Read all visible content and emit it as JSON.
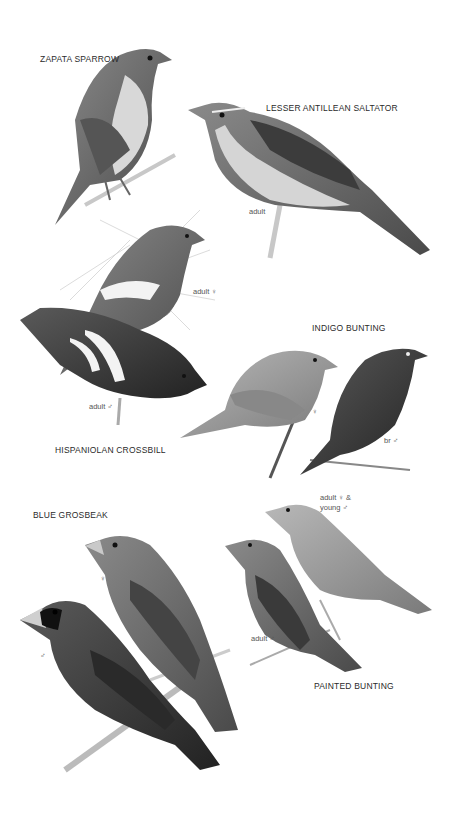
{
  "plate": {
    "species": [
      {
        "name": "ZAPATA SPARROW",
        "labels": []
      },
      {
        "name": "LESSER ANTILLEAN SALTATOR",
        "labels": [
          "adult"
        ]
      },
      {
        "name": "HISPANIOLAN CROSSBILL",
        "labels": [
          "adult ♀",
          "adult ♂"
        ]
      },
      {
        "name": "INDIGO BUNTING",
        "labels": [
          "♀",
          "br ♂"
        ]
      },
      {
        "name": "BLUE GROSBEAK",
        "labels": [
          "♀",
          "♂"
        ]
      },
      {
        "name": "PAINTED BUNTING",
        "labels": [
          "adult ♀ &",
          "young ♂",
          "adult ♂"
        ]
      }
    ]
  }
}
